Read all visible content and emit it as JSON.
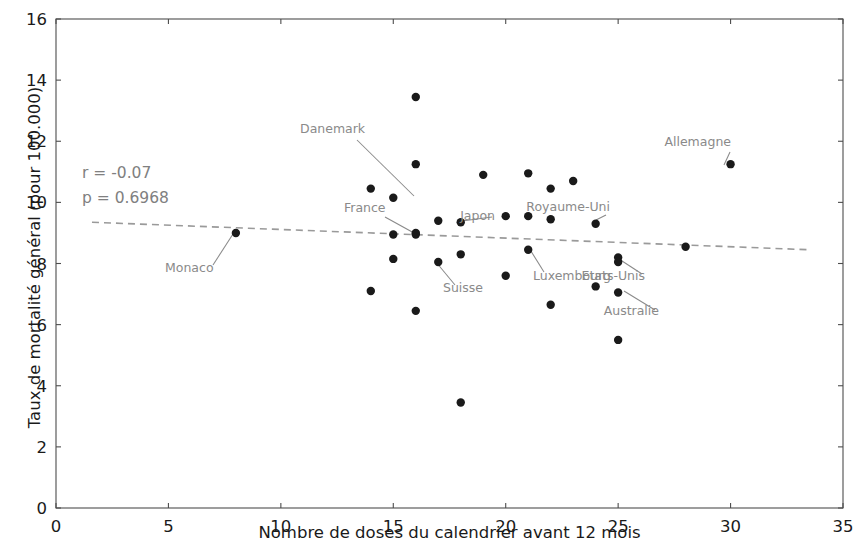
{
  "chart_data": {
    "type": "scatter",
    "title": "",
    "xlabel": "Nombre de doses du calendrier avant 12 mois",
    "ylabel": "Taux de mortalité général (pour 100.000)",
    "xlim": [
      0,
      35
    ],
    "ylim": [
      0,
      16
    ],
    "xticks": [
      0,
      5,
      10,
      15,
      20,
      25,
      30,
      35
    ],
    "yticks": [
      0,
      2,
      4,
      6,
      8,
      10,
      12,
      14,
      16
    ],
    "grid": false,
    "legend": null,
    "annotations": {
      "r_text": "r = -0.07",
      "p_text": "p = 0.6968"
    },
    "statistics": {
      "r": -0.07,
      "p": 0.6968
    },
    "trendline": {
      "style": "dashed",
      "color": "#9a9a9a",
      "x_start": 1.6,
      "y_start": 9.35,
      "x_end": 33.5,
      "y_end": 8.45
    },
    "points": [
      {
        "x": 8.0,
        "y": 9.0,
        "label": "Monaco"
      },
      {
        "x": 14.0,
        "y": 7.1,
        "label": ""
      },
      {
        "x": 14.0,
        "y": 10.45,
        "label": ""
      },
      {
        "x": 15.0,
        "y": 10.15,
        "label": ""
      },
      {
        "x": 15.0,
        "y": 8.95,
        "label": "France"
      },
      {
        "x": 15.0,
        "y": 8.15,
        "label": ""
      },
      {
        "x": 16.0,
        "y": 13.45,
        "label": ""
      },
      {
        "x": 16.0,
        "y": 11.25,
        "label": "Danemark"
      },
      {
        "x": 16.0,
        "y": 8.95,
        "label": ""
      },
      {
        "x": 16.0,
        "y": 9.0,
        "label": ""
      },
      {
        "x": 16.0,
        "y": 6.45,
        "label": ""
      },
      {
        "x": 17.0,
        "y": 9.4,
        "label": ""
      },
      {
        "x": 17.0,
        "y": 8.05,
        "label": "Suisse"
      },
      {
        "x": 18.0,
        "y": 9.35,
        "label": "Japon"
      },
      {
        "x": 18.0,
        "y": 8.3,
        "label": ""
      },
      {
        "x": 18.0,
        "y": 3.45,
        "label": ""
      },
      {
        "x": 19.0,
        "y": 10.9,
        "label": ""
      },
      {
        "x": 20.0,
        "y": 9.55,
        "label": ""
      },
      {
        "x": 20.0,
        "y": 7.6,
        "label": ""
      },
      {
        "x": 21.0,
        "y": 10.95,
        "label": ""
      },
      {
        "x": 21.0,
        "y": 9.55,
        "label": ""
      },
      {
        "x": 21.0,
        "y": 8.45,
        "label": "Luxembourg"
      },
      {
        "x": 22.0,
        "y": 10.45,
        "label": ""
      },
      {
        "x": 22.0,
        "y": 9.45,
        "label": ""
      },
      {
        "x": 22.0,
        "y": 6.65,
        "label": ""
      },
      {
        "x": 23.0,
        "y": 10.7,
        "label": ""
      },
      {
        "x": 24.0,
        "y": 9.3,
        "label": "Royaume-Uni"
      },
      {
        "x": 24.0,
        "y": 7.25,
        "label": ""
      },
      {
        "x": 25.0,
        "y": 8.2,
        "label": "Etats-Unis"
      },
      {
        "x": 25.0,
        "y": 8.05,
        "label": ""
      },
      {
        "x": 25.0,
        "y": 7.05,
        "label": "Australie"
      },
      {
        "x": 25.0,
        "y": 5.5,
        "label": ""
      },
      {
        "x": 28.0,
        "y": 8.55,
        "label": ""
      },
      {
        "x": 30.0,
        "y": 11.25,
        "label": "Allemagne"
      }
    ],
    "point_labels": [
      {
        "text": "Danemark",
        "tx": 300,
        "ty": 133,
        "lx": 357,
        "ly": 140,
        "px": 414,
        "py": 196
      },
      {
        "text": "France",
        "tx": 344,
        "ty": 212,
        "lx": 385,
        "ly": 217,
        "px": 414,
        "py": 233
      },
      {
        "text": "Japon",
        "tx": 495,
        "ty": 220,
        "lx": 492,
        "ly": 217,
        "px": 462,
        "py": 221
      },
      {
        "text": "Monaco",
        "tx": 165,
        "ty": 272,
        "lx": 213,
        "ly": 265,
        "px": 233,
        "py": 234
      },
      {
        "text": "Suisse",
        "tx": 443,
        "ty": 292,
        "lx": 455,
        "ly": 285,
        "px": 436,
        "py": 262
      },
      {
        "text": "Luxembourg",
        "tx": 533,
        "ty": 280,
        "lx": 544,
        "ly": 272,
        "px": 529,
        "py": 248
      },
      {
        "text": "Royaume-Uni",
        "tx": 610,
        "ty": 211,
        "lx": 606,
        "ly": 215,
        "px": 596,
        "py": 220
      },
      {
        "text": "Etats-Unis",
        "tx": 645,
        "ty": 280,
        "lx": 642,
        "ly": 274,
        "px": 619,
        "py": 259
      },
      {
        "text": "Australie",
        "tx": 659,
        "ty": 315,
        "lx": 655,
        "ly": 310,
        "px": 624,
        "py": 291
      },
      {
        "text": "Allemagne",
        "tx": 731,
        "ty": 146,
        "lx": 730,
        "ly": 152,
        "px": 724,
        "py": 165
      }
    ]
  },
  "axis": {
    "xticklabels": [
      "0",
      "5",
      "10",
      "15",
      "20",
      "25",
      "30",
      "35"
    ],
    "yticklabels": [
      "0",
      "2",
      "4",
      "6",
      "8",
      "10",
      "12",
      "14",
      "16"
    ],
    "xlabel": "Nombre de doses du calendrier avant 12 mois",
    "ylabel": "Taux de mortalité général (pour 100.000)"
  },
  "stats_box": {
    "line1": "r = -0.07",
    "line2": "p = 0.6968"
  },
  "colors": {
    "point": "#1a1a1a",
    "trendline": "#9a9a9a",
    "label": "#8a8a8a",
    "axis": "#4d4d4d",
    "text": "#1a1a1a",
    "background": "#ffffff"
  }
}
